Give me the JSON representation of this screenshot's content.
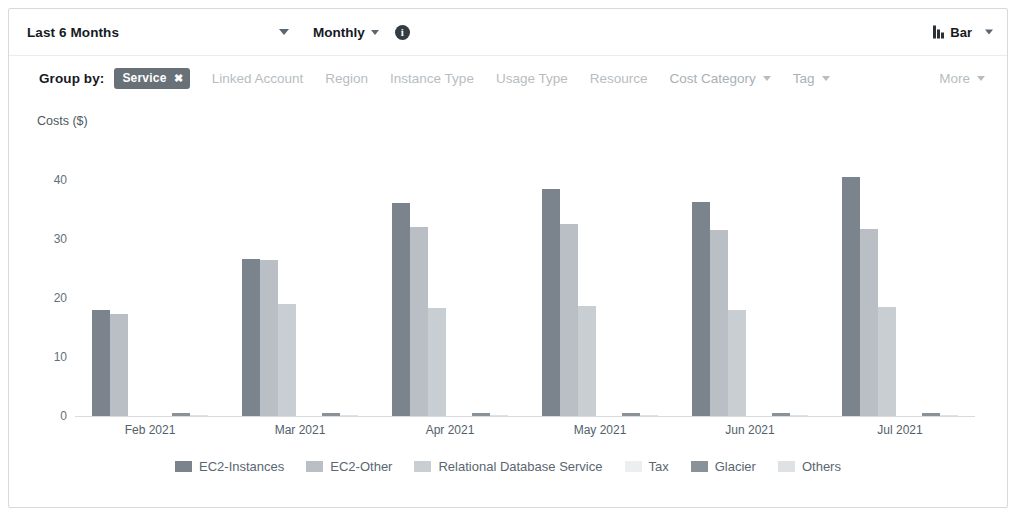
{
  "toolbar": {
    "date_range": "Last 6 Months",
    "granularity": "Monthly",
    "info_icon": "info-icon",
    "chart_type": "Bar",
    "chart_type_icon": "bar-chart-icon"
  },
  "group_by": {
    "title": "Group by:",
    "selected_tag": "Service",
    "selected_tag_close": "✖",
    "options": [
      {
        "label": "Linked Account",
        "has_caret": false
      },
      {
        "label": "Region",
        "has_caret": false
      },
      {
        "label": "Instance Type",
        "has_caret": false
      },
      {
        "label": "Usage Type",
        "has_caret": false
      },
      {
        "label": "Resource",
        "has_caret": false
      },
      {
        "label": "Cost Category",
        "has_caret": true
      },
      {
        "label": "Tag",
        "has_caret": true
      }
    ],
    "more_label": "More"
  },
  "chart_data": {
    "type": "bar",
    "title": "",
    "ylabel": "Costs ($)",
    "xlabel": "",
    "ylim": [
      0,
      44
    ],
    "yticks": [
      0,
      10,
      20,
      30,
      40
    ],
    "grid": false,
    "legend_position": "bottom",
    "categories": [
      "Feb 2021",
      "Mar 2021",
      "Apr 2021",
      "May 2021",
      "Jun 2021",
      "Jul 2021"
    ],
    "series": [
      {
        "name": "EC2-Instances",
        "color": "#7b848c",
        "values": [
          18.0,
          26.5,
          36.0,
          38.5,
          36.2,
          40.5
        ]
      },
      {
        "name": "EC2-Other",
        "color": "#b9bfc4",
        "values": [
          17.2,
          26.4,
          32.0,
          32.5,
          31.5,
          31.6
        ]
      },
      {
        "name": "Relational Database Service",
        "color": "#c9ced2",
        "values": [
          0.0,
          19.0,
          18.2,
          18.6,
          18.0,
          18.5
        ]
      },
      {
        "name": "Tax",
        "color": "#eceeef",
        "values": [
          0.0,
          0.0,
          0.0,
          0.0,
          0.0,
          0.0
        ]
      },
      {
        "name": "Glacier",
        "color": "#8a9299",
        "values": [
          0.45,
          0.45,
          0.45,
          0.45,
          0.45,
          0.45
        ]
      },
      {
        "name": "Others",
        "color": "#dfe2e4",
        "values": [
          0.25,
          0.25,
          0.25,
          0.25,
          0.25,
          0.25
        ]
      }
    ]
  }
}
